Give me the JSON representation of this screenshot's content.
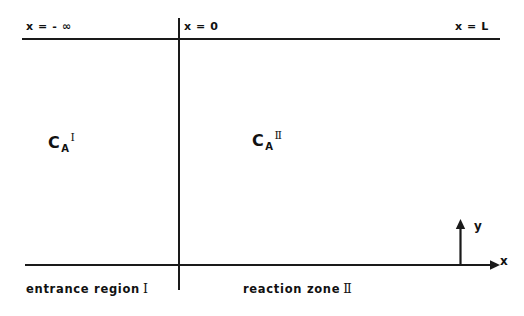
{
  "figure": {
    "background_color": "#ffffff",
    "line_color": "#1a1a1a"
  },
  "boundaries": {
    "left_label": "x = - ∞",
    "interface_label": "x = 0",
    "right_label": "x = L"
  },
  "concentrations": {
    "region1": {
      "base": "C",
      "subscript": "A",
      "superscript": "Ⅰ"
    },
    "region2": {
      "base": "C",
      "subscript": "A",
      "superscript": "Ⅱ"
    }
  },
  "captions": {
    "region1_text": "entrance  region",
    "region1_numeral": "Ⅰ",
    "region2_text": "reaction  zone",
    "region2_numeral": "Ⅱ"
  },
  "axes": {
    "y_label": "y",
    "x_label": "x"
  }
}
